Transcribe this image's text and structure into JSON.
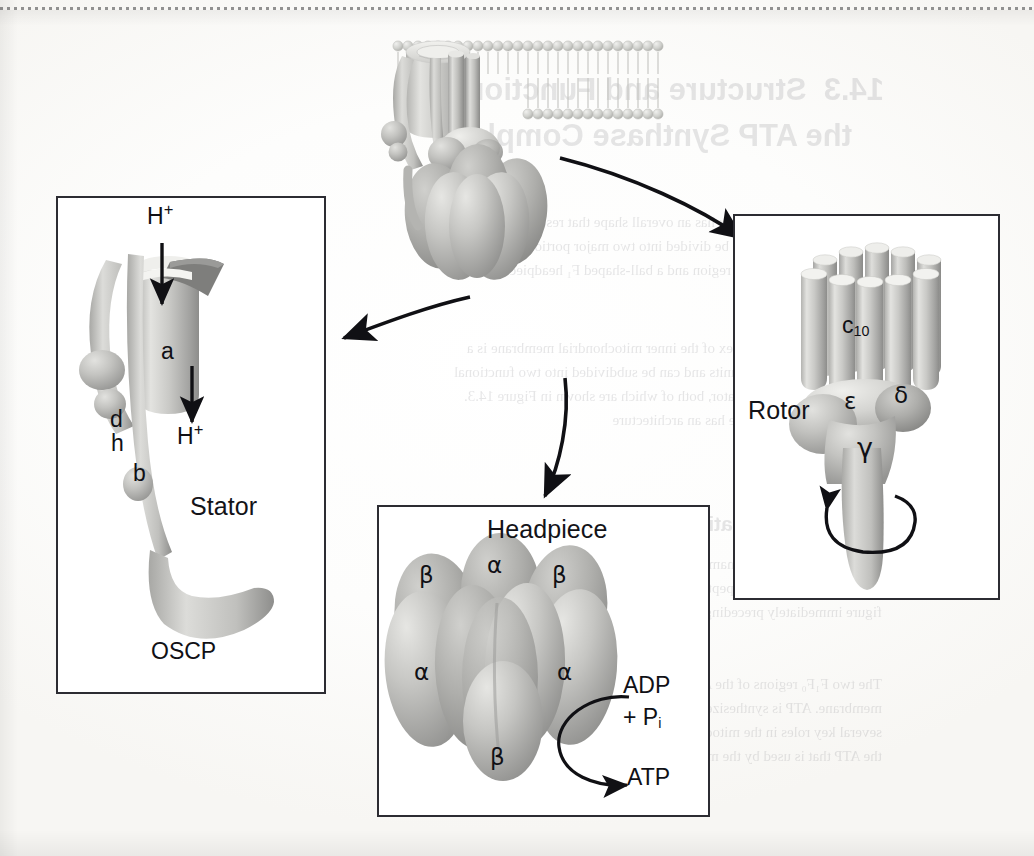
{
  "figure": {
    "background_color": "#fdfdfc",
    "line_color": "#2c2c32",
    "protein_fill_light": "#d5d5d3",
    "protein_fill_mid": "#b9b9b6",
    "protein_fill_dark": "#9b9b99",
    "protein_fill_deep": "#7c7c7a"
  },
  "central": {
    "name": "ATP synthase in membrane",
    "membrane_label": "lipid bilayer"
  },
  "arrows": {
    "to_stator": "arrow-to-stator",
    "to_rotor": "arrow-to-rotor",
    "to_headpiece": "arrow-to-headpiece"
  },
  "panels": {
    "stator": {
      "title": "Stator",
      "labels": {
        "proton_in": "H",
        "proton_in_charge": "+",
        "proton_out": "H",
        "proton_out_charge": "+",
        "subunit_a": "a",
        "subunit_b": "b",
        "subunit_d": "d",
        "subunit_h": "h",
        "oscp": "OSCP"
      }
    },
    "rotor": {
      "title": "Rotor",
      "labels": {
        "c_ring": "c",
        "c_ring_subscript": "10",
        "epsilon": "ε",
        "delta": "δ",
        "gamma": "γ"
      },
      "rotation_arrow": "rotation-arrow"
    },
    "headpiece": {
      "title": "Headpiece",
      "labels": {
        "alpha": "α",
        "beta": "β"
      },
      "subunits": [
        {
          "name": "beta",
          "symbol": "β",
          "position": "upper-left"
        },
        {
          "name": "alpha",
          "symbol": "α",
          "position": "upper-center"
        },
        {
          "name": "beta",
          "symbol": "β",
          "position": "upper-right"
        },
        {
          "name": "alpha",
          "symbol": "α",
          "position": "mid-left"
        },
        {
          "name": "alpha",
          "symbol": "α",
          "position": "mid-right"
        },
        {
          "name": "beta",
          "symbol": "β",
          "position": "bottom-center"
        }
      ],
      "reaction": {
        "substrate_line1": "ADP",
        "substrate_line2_plus": "+ P",
        "substrate_line2_sub": "i",
        "product": "ATP"
      }
    }
  },
  "ghost_text": {
    "note": "faint show-through from the reverse side of the printed page",
    "lines": [
      {
        "text": "14.3  Structure and Function of",
        "x": 150,
        "y": 72,
        "size": 31,
        "style": "head"
      },
      {
        "text": "the ATP Synthase Complex",
        "x": 182,
        "y": 118,
        "size": 31,
        "style": "head"
      },
      {
        "text": "The ATP synthase complex has an overall shape that resembles a ball on",
        "x": 152,
        "y": 214,
        "size": 15,
        "style": "body"
      },
      {
        "text": "a stick. The complex can be divided into two major portions, a stalk-like",
        "x": 152,
        "y": 238,
        "size": 15,
        "style": "body"
      },
      {
        "text": "membrane-embedded F₀ region and a ball-shaped F₁ headpiece that",
        "x": 152,
        "y": 262,
        "size": 15,
        "style": "body"
      },
      {
        "text": "projects into the matrix.",
        "x": 152,
        "y": 286,
        "size": 15,
        "style": "body"
      },
      {
        "text": "The ATP synthase complex of the inner mitochondrial membrane is a",
        "x": 152,
        "y": 340,
        "size": 15,
        "style": "body"
      },
      {
        "text": "large assemblage of subunits and can be subdivided into two functional",
        "x": 152,
        "y": 364,
        "size": 15,
        "style": "body"
      },
      {
        "text": "modules, a rotor and a stator, both of which are shown in Figure 14.3.",
        "x": 152,
        "y": 388,
        "size": 15,
        "style": "body"
      },
      {
        "text": "The overall ATP synthase has an architecture",
        "x": 152,
        "y": 412,
        "size": 15,
        "style": "body"
      },
      {
        "text": "Structural Organization of the ATP Synthase Complex",
        "x": 118,
        "y": 512,
        "size": 21,
        "style": "head"
      },
      {
        "text": "The composition of the mammalian ATP synthase complex is shown in",
        "x": 152,
        "y": 556,
        "size": 15,
        "style": "body"
      },
      {
        "text": "the table below; the polypeptides and their roles are summarized in the",
        "x": 152,
        "y": 580,
        "size": 15,
        "style": "body"
      },
      {
        "text": "figure immediately preceding.",
        "x": 152,
        "y": 604,
        "size": 15,
        "style": "body"
      },
      {
        "text": "The two F₁F₀ regions of the ATP synthase complex in the",
        "x": 152,
        "y": 676,
        "size": 15,
        "style": "body"
      },
      {
        "text": "membrane. ATP is synthesized by the rotation of the rotor of ATP synthase",
        "x": 152,
        "y": 700,
        "size": 15,
        "style": "body"
      },
      {
        "text": "several key roles in the mitochondrion, described in ATP synthase provides",
        "x": 152,
        "y": 724,
        "size": 15,
        "style": "body"
      },
      {
        "text": "the ATP that is used by the matrix enzymes and by reactions",
        "x": 152,
        "y": 748,
        "size": 15,
        "style": "body"
      }
    ]
  }
}
